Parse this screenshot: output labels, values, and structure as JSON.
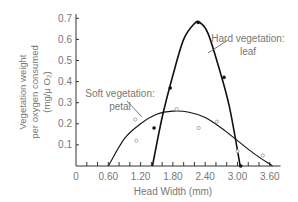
{
  "chart_data": {
    "type": "line",
    "title": "",
    "xlabel": "Head Width (mm)",
    "ylabel_lines": [
      "Vegetation weight",
      "per oxygen consumed",
      "(mg/μ O₂)"
    ],
    "xlim": [
      0,
      3.75
    ],
    "ylim": [
      0,
      0.7
    ],
    "x_ticks": [
      "0",
      "0.60",
      "1.20",
      "1.80",
      "2.40",
      "3.00",
      "3.60"
    ],
    "y_ticks": [
      "0.1",
      "0.2",
      "0.3",
      "0.4",
      "0.5",
      "0.6",
      "0.7"
    ],
    "grid": false,
    "series": [
      {
        "name": "Hard vegetation: leaf",
        "label_lines": [
          "Hard vegetation:",
          "leaf"
        ],
        "marker": "filled",
        "points": [
          [
            1.45,
            0.18
          ],
          [
            1.75,
            0.37
          ],
          [
            2.27,
            0.68
          ],
          [
            2.75,
            0.42
          ],
          [
            3.06,
            0.0
          ]
        ],
        "curve": [
          [
            1.42,
            0.0
          ],
          [
            1.6,
            0.23
          ],
          [
            1.8,
            0.43
          ],
          [
            2.0,
            0.6
          ],
          [
            2.2,
            0.675
          ],
          [
            2.3,
            0.68
          ],
          [
            2.45,
            0.63
          ],
          [
            2.65,
            0.47
          ],
          [
            2.85,
            0.28
          ],
          [
            3.05,
            0.0
          ]
        ]
      },
      {
        "name": "Soft vegetation: petal",
        "label_lines": [
          "Soft vegetation:",
          "petal"
        ],
        "marker": "open",
        "points": [
          [
            1.1,
            0.22
          ],
          [
            1.12,
            0.12
          ],
          [
            1.87,
            0.27
          ],
          [
            2.28,
            0.18
          ],
          [
            2.62,
            0.21
          ],
          [
            3.0,
            0.07
          ],
          [
            3.47,
            0.05
          ]
        ],
        "curve": [
          [
            0.6,
            0.0
          ],
          [
            0.9,
            0.13
          ],
          [
            1.2,
            0.2
          ],
          [
            1.5,
            0.245
          ],
          [
            1.8,
            0.26
          ],
          [
            2.1,
            0.255
          ],
          [
            2.4,
            0.23
          ],
          [
            2.7,
            0.18
          ],
          [
            3.0,
            0.12
          ],
          [
            3.3,
            0.06
          ],
          [
            3.65,
            0.0
          ]
        ]
      }
    ]
  }
}
